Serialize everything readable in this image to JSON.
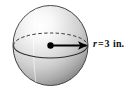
{
  "figure": {
    "kind": "sphere-radius-diagram",
    "background_color": "#ffffff",
    "sphere": {
      "name": "shaded-sphere",
      "center_x": 50.5,
      "center_y": 45.5,
      "radius_x": 37.5,
      "radius_y": 40.0,
      "outline_color": "#3a3a3a",
      "fill_light": "#fefefe",
      "fill_mid": "#d2d2d2",
      "fill_dark": "#8e8e8e",
      "highlight_x": 33,
      "highlight_y": 22
    },
    "equator": {
      "name": "equator-ellipse",
      "radius_x": 37.0,
      "radius_y": 12.5,
      "upper_arc_style": "dashed",
      "lower_arc_style": "solid",
      "stroke_color": "#2b2b2b"
    },
    "center_point": {
      "name": "center-dot",
      "x": 50.5,
      "y": 45.5,
      "radius": 3.2,
      "color": "#000000"
    },
    "radius_line": {
      "name": "radius-arrow",
      "from_x": 50.5,
      "from_y": 45.5,
      "to_x": 89.0,
      "to_y": 45.5,
      "color": "#000000",
      "arrowhead": "right"
    },
    "label": {
      "name": "radius-label",
      "symbol": "r",
      "equals": "=",
      "value": "3",
      "unit": "in.",
      "full_text": "r = 3 in.",
      "color": "#101010"
    }
  }
}
